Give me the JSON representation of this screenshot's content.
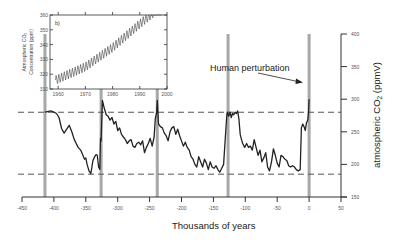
{
  "chart_data": [
    {
      "id": "main",
      "type": "line",
      "title": "",
      "xlabel": "Thousands of years",
      "ylabel": "atmospheric CO2 (ppmV)",
      "xlim": [
        -450,
        50
      ],
      "ylim": [
        150,
        400
      ],
      "x_ticks": [
        -450,
        -400,
        -350,
        -300,
        -250,
        -200,
        -150,
        -100,
        -50,
        0,
        50
      ],
      "x_tick_labels": [
        "-450",
        "-400",
        "-350",
        "-300",
        "-250",
        "-200",
        "-150",
        "-100",
        "-50",
        "0",
        "50"
      ],
      "y_ticks": [
        150,
        200,
        250,
        300,
        350,
        400
      ],
      "y_tick_labels": [
        "150",
        "200",
        "250",
        "300",
        "350",
        "400"
      ],
      "y_axis_position": "right",
      "grid": false,
      "reference_lines": [
        {
          "orientation": "horizontal",
          "value": 280,
          "style": "dashed"
        },
        {
          "orientation": "horizontal",
          "value": 185,
          "style": "dashed"
        }
      ],
      "interglacial_markers_kyr": [
        -414,
        -326,
        -238,
        -127,
        0
      ],
      "annotation": {
        "text": "Human perturbation",
        "arrow_to": [
          -2,
          340
        ]
      },
      "series": [
        {
          "name": "Vostok CO2",
          "x": [
            -414,
            -410,
            -405,
            -400,
            -396,
            -392,
            -388,
            -384,
            -380,
            -376,
            -372,
            -368,
            -365,
            -362,
            -358,
            -355,
            -352,
            -350,
            -348,
            -345,
            -342,
            -339,
            -336,
            -334,
            -332,
            -330,
            -328,
            -327,
            -326,
            -324,
            -321,
            -318,
            -315,
            -312,
            -309,
            -306,
            -303,
            -300,
            -297,
            -294,
            -291,
            -288,
            -285,
            -282,
            -279,
            -276,
            -273,
            -270,
            -267,
            -264,
            -261,
            -258,
            -255,
            -252,
            -249,
            -246,
            -243,
            -241,
            -239,
            -238,
            -236,
            -233,
            -230,
            -227,
            -224,
            -221,
            -218,
            -215,
            -212,
            -209,
            -206,
            -203,
            -200,
            -197,
            -194,
            -191,
            -188,
            -185,
            -182,
            -179,
            -176,
            -173,
            -170,
            -167,
            -164,
            -161,
            -158,
            -155,
            -152,
            -149,
            -146,
            -143,
            -140,
            -137,
            -134,
            -131,
            -129,
            -128,
            -126,
            -124,
            -122,
            -120,
            -118,
            -116,
            -114,
            -112,
            -110,
            -108,
            -106,
            -104,
            -101,
            -98,
            -95,
            -92,
            -89,
            -86,
            -83,
            -80,
            -77,
            -74,
            -71,
            -68,
            -65,
            -62,
            -59,
            -56,
            -53,
            -50,
            -47,
            -44,
            -41,
            -38,
            -35,
            -32,
            -29,
            -26,
            -23,
            -20,
            -17,
            -14,
            -12,
            -10,
            -8,
            -6,
            -4,
            -2,
            -1,
            0
          ],
          "values": [
            280,
            281,
            282,
            280,
            278,
            272,
            255,
            248,
            254,
            260,
            250,
            238,
            232,
            226,
            222,
            215,
            208,
            210,
            200,
            190,
            186,
            205,
            212,
            215,
            214,
            196,
            192,
            240,
            236,
            298,
            286,
            276,
            274,
            268,
            272,
            262,
            266,
            252,
            256,
            246,
            242,
            238,
            232,
            236,
            238,
            228,
            226,
            232,
            234,
            230,
            236,
            218,
            226,
            232,
            240,
            228,
            242,
            270,
            280,
            298,
            262,
            258,
            256,
            248,
            244,
            236,
            250,
            256,
            258,
            246,
            254,
            244,
            236,
            228,
            234,
            226,
            222,
            212,
            208,
            200,
            196,
            212,
            204,
            196,
            208,
            202,
            192,
            204,
            196,
            194,
            198,
            192,
            188,
            194,
            200,
            245,
            275,
            280,
            274,
            280,
            272,
            278,
            276,
            280,
            278,
            282,
            270,
            246,
            238,
            232,
            226,
            232,
            226,
            228,
            222,
            238,
            226,
            214,
            222,
            204,
            210,
            218,
            196,
            190,
            204,
            224,
            214,
            202,
            196,
            214,
            212,
            208,
            206,
            198,
            196,
            198,
            196,
            192,
            190,
            192,
            256,
            262,
            258,
            252,
            264,
            268,
            280,
            300,
            356
          ]
        }
      ]
    },
    {
      "id": "inset",
      "type": "line",
      "title": "b)",
      "xlabel": "",
      "ylabel": "Atmospheric CO2 Concentration (ppm)",
      "xlim": [
        1957,
        2000
      ],
      "ylim": [
        310,
        360
      ],
      "x_ticks": [
        1960,
        1970,
        1980,
        1990,
        2000
      ],
      "x_tick_labels": [
        "1960",
        "1970",
        "1980",
        "1990",
        "2000"
      ],
      "y_ticks": [
        310,
        320,
        330,
        340,
        350,
        360
      ],
      "y_tick_labels": [
        "310",
        "320",
        "330",
        "340",
        "350",
        "360"
      ],
      "grid": false,
      "series": [
        {
          "name": "Mauna Loa CO2 (seasonal cycle)",
          "x_start": 1959,
          "x_end": 1998,
          "trend_values": [
            {
              "x": 1959,
              "y": 316
            },
            {
              "x": 1970,
              "y": 325
            },
            {
              "x": 1980,
              "y": 338
            },
            {
              "x": 1990,
              "y": 354
            },
            {
              "x": 1998,
              "y": 366
            }
          ],
          "seasonal_amplitude_ppm": 3
        }
      ]
    }
  ],
  "labels": {
    "xlabel": "Thousands of years",
    "ylabel_main": "atmospheric CO",
    "ylabel_sub": "2",
    "ylabel_unit": " (ppmV)",
    "annotation": "Human perturbation",
    "inset_panel": "b)",
    "inset_ylabel_line1": "Atmospheric CO",
    "inset_ylabel_sub": "2",
    "inset_ylabel_line2": "Concentration (ppm)"
  },
  "colors": {
    "line": "#222222",
    "axis": "#333333",
    "dashed": "#555555",
    "marker_bar": "#a8a8a8",
    "tick_text": "#555555"
  }
}
